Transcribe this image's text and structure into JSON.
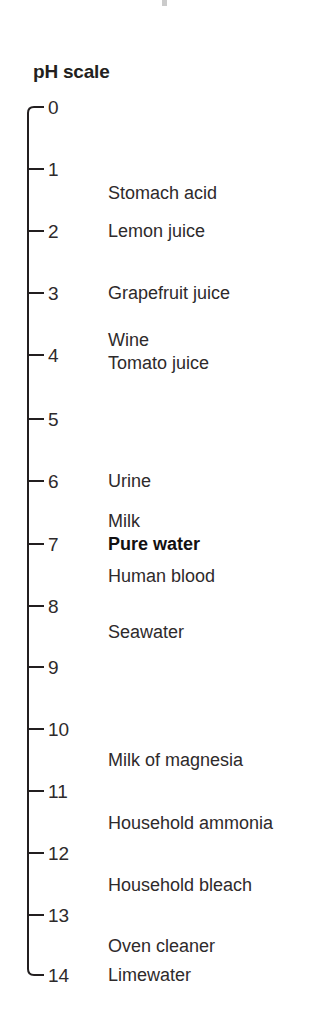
{
  "title": "pH scale",
  "axis": {
    "orientation": "vertical",
    "line_color": "#231f20",
    "min": 0,
    "max": 14,
    "x_line": 28,
    "x_tick_end": 44,
    "y_top": 107,
    "y_bottom": 975
  },
  "ticks": [
    {
      "label": "0",
      "value": 0,
      "y": 107
    },
    {
      "label": "1",
      "value": 1,
      "y": 169
    },
    {
      "label": "2",
      "value": 2,
      "y": 231
    },
    {
      "label": "3",
      "value": 3,
      "y": 293
    },
    {
      "label": "4",
      "value": 4,
      "y": 355
    },
    {
      "label": "5",
      "value": 5,
      "y": 419
    },
    {
      "label": "6",
      "value": 6,
      "y": 481
    },
    {
      "label": "7",
      "value": 7,
      "y": 544
    },
    {
      "label": "8",
      "value": 8,
      "y": 606
    },
    {
      "label": "9",
      "value": 9,
      "y": 667
    },
    {
      "label": "10",
      "value": 10,
      "y": 729
    },
    {
      "label": "11",
      "value": 11,
      "y": 791
    },
    {
      "label": "12",
      "value": 12,
      "y": 853
    },
    {
      "label": "13",
      "value": 13,
      "y": 915
    },
    {
      "label": "14",
      "value": 14,
      "y": 975
    }
  ],
  "substances": [
    {
      "name": "Stomach acid",
      "ph": 1.5,
      "y": 193,
      "bold": false
    },
    {
      "name": "Lemon juice",
      "ph": 2.0,
      "y": 231,
      "bold": false
    },
    {
      "name": "Grapefruit juice",
      "ph": 3.0,
      "y": 293,
      "bold": false
    },
    {
      "name": "Wine",
      "ph": 3.7,
      "y": 340,
      "bold": false
    },
    {
      "name": "Tomato juice",
      "ph": 4.0,
      "y": 363,
      "bold": false
    },
    {
      "name": "Urine",
      "ph": 6.0,
      "y": 481,
      "bold": false
    },
    {
      "name": "Milk",
      "ph": 6.7,
      "y": 521,
      "bold": false
    },
    {
      "name": "Pure water",
      "ph": 7.0,
      "y": 544,
      "bold": true
    },
    {
      "name": "Human blood",
      "ph": 7.4,
      "y": 576,
      "bold": false
    },
    {
      "name": "Seawater",
      "ph": 8.4,
      "y": 632,
      "bold": false
    },
    {
      "name": "Milk of magnesia",
      "ph": 10.5,
      "y": 760,
      "bold": false
    },
    {
      "name": "Household ammonia",
      "ph": 11.5,
      "y": 823,
      "bold": false
    },
    {
      "name": "Household bleach",
      "ph": 12.5,
      "y": 885,
      "bold": false
    },
    {
      "name": "Oven cleaner",
      "ph": 13.5,
      "y": 946,
      "bold": false
    },
    {
      "name": "Limewater",
      "ph": 14.0,
      "y": 975,
      "bold": false
    }
  ],
  "chart_data": {
    "type": "scatter",
    "title": "pH scale",
    "xlabel": "",
    "ylabel": "pH",
    "ylim": [
      0,
      14
    ],
    "grid": false,
    "legend": "none",
    "tick_labels": [
      "0",
      "1",
      "2",
      "3",
      "4",
      "5",
      "6",
      "7",
      "8",
      "9",
      "10",
      "11",
      "12",
      "13",
      "14"
    ],
    "categories": [
      "Stomach acid",
      "Lemon juice",
      "Grapefruit juice",
      "Wine",
      "Tomato juice",
      "Urine",
      "Milk",
      "Pure water",
      "Human blood",
      "Seawater",
      "Milk of magnesia",
      "Household ammonia",
      "Household bleach",
      "Oven cleaner",
      "Limewater"
    ],
    "values": [
      1.5,
      2.0,
      3.0,
      3.7,
      4.0,
      6.0,
      6.7,
      7.0,
      7.4,
      8.4,
      10.5,
      11.5,
      12.5,
      13.5,
      14.0
    ],
    "annotations": [
      {
        "text": "Pure water",
        "value": 7.0,
        "emphasis": "bold"
      }
    ]
  }
}
